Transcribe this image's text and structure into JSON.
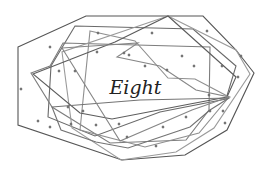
{
  "figure": {
    "center_label": "Eight",
    "label_position": {
      "x": 135,
      "y": 78
    },
    "colors": {
      "background": "#ffffff",
      "lines": [
        "#555555",
        "#6a6a6a",
        "#7d7d7d",
        "#8f8f8f",
        "#9a9a9a",
        "#5c5c5c",
        "#737373",
        "#868686"
      ],
      "dots": "#6e6e6e",
      "text": "#222222"
    },
    "polygons": [
      {
        "name": "outer-octagon",
        "points": "18,47 86,16 203,16 236,50 254,73 227,130 185,155 122,160 18,125"
      },
      {
        "name": "octagon-2",
        "points": "75,26 193,29 236,66 226,99 160,112 95,136 48,117 51,66"
      },
      {
        "name": "octagon-3",
        "points": "63,43 210,47 209,110 186,140 110,143 52,107 31,73 50,66"
      },
      {
        "name": "octagon-4",
        "points": "90,31 135,41 168,78 195,79 229,97 199,133 145,147 80,130"
      },
      {
        "name": "octagon-5",
        "points": "168,16 236,50 250,74 214,128 176,152 121,160 72,128 62,52"
      },
      {
        "name": "octagon-6",
        "points": "33,74 115,42 168,16 236,77 227,97 190,104 112,119 80,113"
      },
      {
        "name": "octagon-7",
        "points": "52,107 140,100 229,98 210,110 190,127 128,148 96,142 61,130"
      },
      {
        "name": "octagon-8",
        "points": "62,48 138,43 117,57 160,66 196,90 229,97 192,110 120,141"
      }
    ],
    "dots": [
      [
        21,
        89
      ],
      [
        50,
        47
      ],
      [
        98,
        33
      ],
      [
        97,
        52
      ],
      [
        124,
        53
      ],
      [
        129,
        55
      ],
      [
        145,
        66
      ],
      [
        152,
        33
      ],
      [
        182,
        56
      ],
      [
        194,
        66
      ],
      [
        207,
        31
      ],
      [
        222,
        66
      ],
      [
        241,
        56
      ],
      [
        238,
        77
      ],
      [
        75,
        71
      ],
      [
        59,
        71
      ],
      [
        68,
        107
      ],
      [
        83,
        111
      ],
      [
        71,
        124
      ],
      [
        38,
        121
      ],
      [
        50,
        127
      ],
      [
        96,
        125
      ],
      [
        127,
        137
      ],
      [
        156,
        146
      ],
      [
        163,
        127
      ],
      [
        186,
        117
      ],
      [
        210,
        111
      ],
      [
        223,
        111
      ],
      [
        225,
        123
      ],
      [
        209,
        95
      ],
      [
        167,
        70
      ],
      [
        119,
        124
      ]
    ]
  }
}
